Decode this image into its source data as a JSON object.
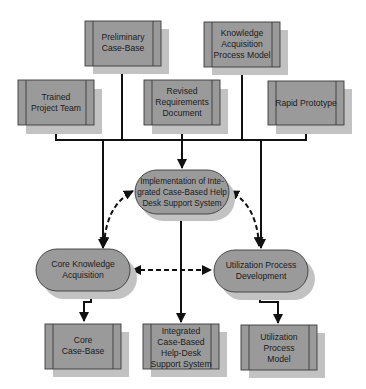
{
  "diagram": {
    "type": "process-flow",
    "colors": {
      "node_fill": "#9a9a9a",
      "node_shadow": "#c2c2c2",
      "node_border": "#3a3a3a",
      "connector": "#111111",
      "background": "#ffffff"
    },
    "input_boxes": [
      {
        "id": "preliminary-case-base",
        "lines": [
          "Preliminary",
          "Case-Base"
        ]
      },
      {
        "id": "knowledge-acquisition-process-model",
        "lines": [
          "Knowledge",
          "Acquisition",
          "Process Model"
        ]
      },
      {
        "id": "trained-project-team",
        "lines": [
          "Trained",
          "Project Team"
        ]
      },
      {
        "id": "revised-requirements-document",
        "lines": [
          "Revised",
          "Requirements",
          "Document"
        ]
      },
      {
        "id": "rapid-prototype",
        "lines": [
          "Rapid Prototype"
        ]
      }
    ],
    "process_ovals": [
      {
        "id": "implementation",
        "lines": [
          "Implementation of  Inte-",
          "grated Case-Based Help",
          "Desk Support System"
        ]
      },
      {
        "id": "core-knowledge-acquisition",
        "lines": [
          "Core Knowledge",
          "Acquisition"
        ]
      },
      {
        "id": "utilization-process-development",
        "lines": [
          "Utilization Process",
          "Development"
        ]
      }
    ],
    "output_boxes": [
      {
        "id": "core-case-base",
        "lines": [
          "Core",
          "Case-Base"
        ]
      },
      {
        "id": "integrated-help-desk",
        "lines": [
          "Integrated",
          "Case-Based",
          "Help-Desk",
          "Support System"
        ]
      },
      {
        "id": "utilization-process-model",
        "lines": [
          "Utilization",
          "Process",
          "Model"
        ]
      }
    ],
    "edges": [
      {
        "from": "all-inputs",
        "to": "implementation",
        "style": "solid"
      },
      {
        "from": "all-inputs",
        "to": "core-knowledge-acquisition",
        "style": "solid"
      },
      {
        "from": "all-inputs",
        "to": "utilization-process-development",
        "style": "solid"
      },
      {
        "from": "core-knowledge-acquisition",
        "to": "implementation",
        "style": "dashed",
        "bidirectional": true
      },
      {
        "from": "utilization-process-development",
        "to": "implementation",
        "style": "dashed",
        "bidirectional": true
      },
      {
        "from": "core-knowledge-acquisition",
        "to": "utilization-process-development",
        "style": "dashed",
        "bidirectional": true
      },
      {
        "from": "core-knowledge-acquisition",
        "to": "core-case-base",
        "style": "solid"
      },
      {
        "from": "implementation",
        "to": "integrated-help-desk",
        "style": "solid"
      },
      {
        "from": "utilization-process-development",
        "to": "utilization-process-model",
        "style": "solid"
      }
    ]
  }
}
